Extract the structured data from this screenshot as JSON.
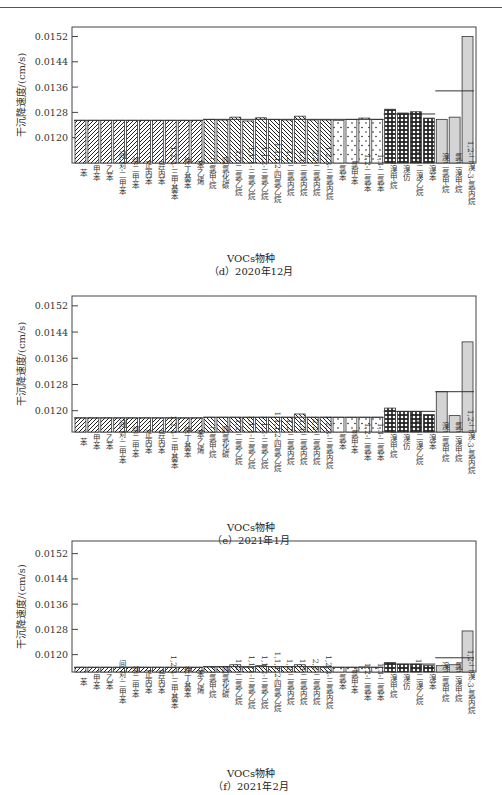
{
  "page": {
    "header_rule": true
  },
  "chart_data": [
    {
      "id": "d",
      "type": "bar",
      "title": "(d) 2020年12月",
      "xlabel": "VOCs物种",
      "ylabel": "干沉降速度/(cm/s)",
      "ylim": [
        0.0112,
        0.0155
      ],
      "yticks": [
        "0.0120",
        "0.0128",
        "0.0136",
        "0.0144",
        "0.0152"
      ],
      "grid": false,
      "categories": [
        "苯",
        "甲苯",
        "乙苯",
        "间,对-二甲苯",
        "邻二甲苯",
        "正丙苯",
        "异丙苯",
        "1,2,4-三甲基苯",
        "仲丁基苯",
        "苯乙烯",
        "二氯甲烷",
        "四氯化碳",
        "1,2-二氯乙烷",
        "1,1,1-三氯乙烷",
        "1,1,2-三氯乙烷",
        "1,1,1,2-四氯乙烷",
        "1,2-二氯丙烷",
        "1,3-二氯丙烷",
        "2,2-二氯丙烷",
        "1,2,3-三氯丙烷",
        "氯苯",
        "氯甲苯",
        "1,2-二氯苯",
        "1,3-二氯苯",
        "二溴甲烷",
        "溴仿",
        "1,2-二溴乙烷",
        "溴苯",
        "溴二氯甲烷",
        "氯二溴甲烷",
        "1,2-二溴-3-氯丙烷"
      ],
      "groups": [
        "aromatic",
        "aromatic",
        "aromatic",
        "aromatic",
        "aromatic",
        "aromatic",
        "aromatic",
        "aromatic",
        "aromatic",
        "aromatic",
        "chloroalkane",
        "chloroalkane",
        "chloroalkane",
        "chloroalkane",
        "chloroalkane",
        "chloroalkane",
        "chloroalkane",
        "chloroalkane",
        "chloroalkane",
        "chloroalkane",
        "chloroaromatic",
        "chloroaromatic",
        "chloroaromatic",
        "chloroaromatic",
        "bromide",
        "bromide",
        "bromide",
        "bromide",
        "mixed-halide",
        "mixed-halide",
        "mixed-halide"
      ],
      "values": [
        0.01255,
        0.01255,
        0.01255,
        0.01255,
        0.01255,
        0.01255,
        0.01255,
        0.01255,
        0.01255,
        0.01255,
        0.01258,
        0.01256,
        0.01265,
        0.01253,
        0.01263,
        0.01258,
        0.01256,
        0.01268,
        0.01256,
        0.01256,
        0.01255,
        0.01258,
        0.01262,
        0.01258,
        0.0129,
        0.01278,
        0.01282,
        0.01262,
        0.01258,
        0.01265,
        0.0152
      ],
      "group_means": [
        {
          "group": "aromatic",
          "value": 0.01255
        },
        {
          "group": "chloroalkane",
          "value": 0.01258
        },
        {
          "group": "chloroaromatic",
          "value": 0.01258
        },
        {
          "group": "bromide",
          "value": 0.01275
        },
        {
          "group": "mixed-halide",
          "value": 0.01348
        }
      ]
    },
    {
      "id": "e",
      "type": "bar",
      "title": "(e) 2021年1月",
      "xlabel": "VOCs物种",
      "ylabel": "干沉降速度/(cm/s)",
      "ylim": [
        0.01135,
        0.0155
      ],
      "yticks": [
        "0.0120",
        "0.0128",
        "0.0136",
        "0.0144",
        "0.0152"
      ],
      "grid": false,
      "categories": [
        "苯",
        "甲苯",
        "乙苯",
        "间,对-二甲苯",
        "邻二甲苯",
        "正丙苯",
        "异丙苯",
        "1,2,4-三甲基苯",
        "仲丁基苯",
        "苯乙烯",
        "二氯甲烷",
        "四氯化碳",
        "1,2-二氯乙烷",
        "1,1,1-三氯乙烷",
        "1,1,2-三氯乙烷",
        "1,1,1,2-四氯乙烷",
        "1,2-二氯丙烷",
        "1,3-二氯丙烷",
        "2,2-二氯丙烷",
        "1,2,3-三氯丙烷",
        "氯苯",
        "氯甲苯",
        "1,2-二氯苯",
        "1,3-二氯苯",
        "二溴甲烷",
        "溴仿",
        "1,2-二溴乙烷",
        "溴苯",
        "溴二氯甲烷",
        "氯二溴甲烷",
        "1,2-二溴-3-氯丙烷"
      ],
      "groups": [
        "aromatic",
        "aromatic",
        "aromatic",
        "aromatic",
        "aromatic",
        "aromatic",
        "aromatic",
        "aromatic",
        "aromatic",
        "aromatic",
        "chloroalkane",
        "chloroalkane",
        "chloroalkane",
        "chloroalkane",
        "chloroalkane",
        "chloroalkane",
        "chloroalkane",
        "chloroalkane",
        "chloroalkane",
        "chloroalkane",
        "chloroaromatic",
        "chloroaromatic",
        "chloroaromatic",
        "chloroaromatic",
        "bromide",
        "bromide",
        "bromide",
        "bromide",
        "mixed-halide",
        "mixed-halide",
        "mixed-halide"
      ],
      "values": [
        0.01178,
        0.01178,
        0.01178,
        0.01178,
        0.01178,
        0.01178,
        0.01178,
        0.01178,
        0.01178,
        0.01178,
        0.0118,
        0.0118,
        0.0118,
        0.0118,
        0.0118,
        0.0118,
        0.0118,
        0.0119,
        0.0118,
        0.0118,
        0.0118,
        0.0118,
        0.0118,
        0.0118,
        0.01208,
        0.01198,
        0.01198,
        0.01188,
        0.01258,
        0.01185,
        0.0141
      ],
      "group_means": [
        {
          "group": "aromatic",
          "value": 0.01178
        },
        {
          "group": "chloroalkane",
          "value": 0.0118
        },
        {
          "group": "chloroaromatic",
          "value": 0.0118
        },
        {
          "group": "bromide",
          "value": 0.01198
        },
        {
          "group": "mixed-halide",
          "value": 0.01258
        }
      ]
    },
    {
      "id": "f",
      "type": "bar",
      "title": "(f) 2021年2月",
      "xlabel": "VOCs物种",
      "ylabel": "干沉降速度/(cm/s)",
      "ylim": [
        0.01145,
        0.0156
      ],
      "yticks": [
        "0.0120",
        "0.0128",
        "0.0136",
        "0.0144",
        "0.0152"
      ],
      "grid": false,
      "categories": [
        "苯",
        "甲苯",
        "乙苯",
        "间,对-二甲苯",
        "邻二甲苯",
        "正丙苯",
        "异丙苯",
        "1,2,4-三甲基苯",
        "仲丁基苯",
        "苯乙烯",
        "二氯甲烷",
        "四氯化碳",
        "1,2-二氯乙烷",
        "1,1,1-三氯乙烷",
        "1,1,2-三氯乙烷",
        "1,1,1,2-四氯乙烷",
        "1,2-二氯丙烷",
        "1,3-二氯丙烷",
        "2,2-二氯丙烷",
        "1,2,3-三氯丙烷",
        "氯苯",
        "氯甲苯",
        "1,2-二氯苯",
        "1,3-二氯苯",
        "二溴甲烷",
        "溴仿",
        "1,2-二溴乙烷",
        "溴苯",
        "溴二氯甲烷",
        "氯二溴甲烷",
        "1,2-二溴-3-氯丙烷"
      ],
      "groups": [
        "aromatic",
        "aromatic",
        "aromatic",
        "aromatic",
        "aromatic",
        "aromatic",
        "aromatic",
        "aromatic",
        "aromatic",
        "aromatic",
        "chloroalkane",
        "chloroalkane",
        "chloroalkane",
        "chloroalkane",
        "chloroalkane",
        "chloroalkane",
        "chloroalkane",
        "chloroalkane",
        "chloroalkane",
        "chloroalkane",
        "chloroaromatic",
        "chloroaromatic",
        "chloroaromatic",
        "chloroaromatic",
        "bromide",
        "bromide",
        "bromide",
        "bromide",
        "mixed-halide",
        "mixed-halide",
        "mixed-halide"
      ],
      "values": [
        0.0116,
        0.0116,
        0.0116,
        0.0116,
        0.0116,
        0.0116,
        0.0116,
        0.0116,
        0.0116,
        0.0116,
        0.01161,
        0.01161,
        0.01168,
        0.0116,
        0.01165,
        0.01161,
        0.01161,
        0.01168,
        0.01161,
        0.0116,
        0.0116,
        0.0116,
        0.01161,
        0.0116,
        0.01175,
        0.0117,
        0.0117,
        0.01165,
        0.01165,
        0.01168,
        0.01275
      ],
      "group_means": [
        {
          "group": "aromatic",
          "value": 0.0116
        },
        {
          "group": "chloroalkane",
          "value": 0.01162
        },
        {
          "group": "chloroaromatic",
          "value": 0.0116
        },
        {
          "group": "bromide",
          "value": 0.0117
        },
        {
          "group": "mixed-halide",
          "value": 0.0119
        }
      ]
    }
  ],
  "captions": {
    "d": {
      "xlabel": "VOCs物种",
      "title": "（d）2020年12月"
    },
    "e": {
      "xlabel": "VOCs物种",
      "title": "（e）2021年1月"
    },
    "f": {
      "xlabel": "VOCs物种",
      "title": "（f）2021年2月"
    }
  }
}
